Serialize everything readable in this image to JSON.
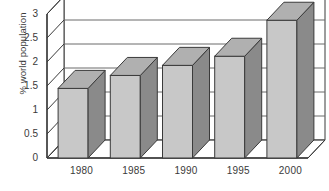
{
  "chart_data": {
    "type": "bar",
    "title": "",
    "subtitle": "",
    "xlabel": "",
    "ylabel": "% world population",
    "categories": [
      "1980",
      "1985",
      "1990",
      "1995",
      "2000"
    ],
    "values": [
      1.45,
      1.72,
      1.93,
      2.12,
      2.87
    ],
    "series": [
      {
        "name": "% world population",
        "values": [
          1.45,
          1.72,
          1.93,
          2.12,
          2.87
        ]
      }
    ],
    "ylim": [
      0,
      3
    ],
    "xlim": [
      0,
      5
    ],
    "y_ticks": [
      "0",
      "0.5",
      "1",
      "1.5",
      "2",
      "2.5",
      "3"
    ],
    "y_tick_values": [
      0,
      0.5,
      1,
      1.5,
      2,
      2.5,
      3
    ],
    "grid": true,
    "grid_axis": "y",
    "legend": false,
    "legend_position": "none",
    "style": "3d-column",
    "annotations": []
  },
  "colors": {
    "bar_front": "#c8c8c8",
    "bar_side": "#8a8a8a",
    "bar_top": "#b0b0b0",
    "bar_outline": "#3a3a3a",
    "axis_line": "#3a3a3a",
    "grid_line": "#6a6a6a",
    "wall": "#ffffff",
    "floor": "#ffffff",
    "background": "#ffffff",
    "text": "#3a3a3a"
  }
}
